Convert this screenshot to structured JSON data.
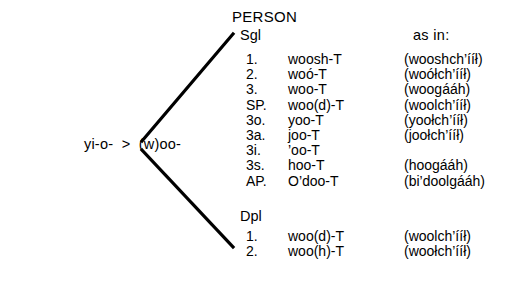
{
  "root": {
    "label": "yi-o-  >  (w)oo-"
  },
  "headings": {
    "person": "PERSON",
    "singular": "Sgl",
    "dual_plural": "Dpl",
    "as_in": "as in:"
  },
  "singular_rows": [
    {
      "person": "1.",
      "form": "woosh-T",
      "example": "(wooshch’ííł)"
    },
    {
      "person": "2.",
      "form": "woó-T",
      "example": "(woółch’ííł)"
    },
    {
      "person": "3.",
      "form": "woo-T",
      "example": "(woogááh)"
    },
    {
      "person": "SP.",
      "form": "woo(d)-T",
      "example": "(woolch’ííł)"
    },
    {
      "person": "3o.",
      "form": "yoo-T",
      "example": "(yoołch’ííł)"
    },
    {
      "person": "3a.",
      "form": "joo-T",
      "example": "(joołch’ííł)"
    },
    {
      "person": "3i.",
      "form": "’oo-T",
      "example": ""
    },
    {
      "person": "3s.",
      "form": "hoo-T",
      "example": "(hoogááh)"
    },
    {
      "person": "AP.",
      "form": "O’doo-T",
      "example": "(bi’doolgááh)"
    }
  ],
  "dual_plural_rows": [
    {
      "person": "1.",
      "form": "woo(d)-T",
      "example": "(woolch’ííł)"
    },
    {
      "person": "2.",
      "form": "woo(h)-T",
      "example": "(woołch’ííł)"
    }
  ],
  "colors": {
    "ink": "#000000",
    "background": "#ffffff"
  }
}
